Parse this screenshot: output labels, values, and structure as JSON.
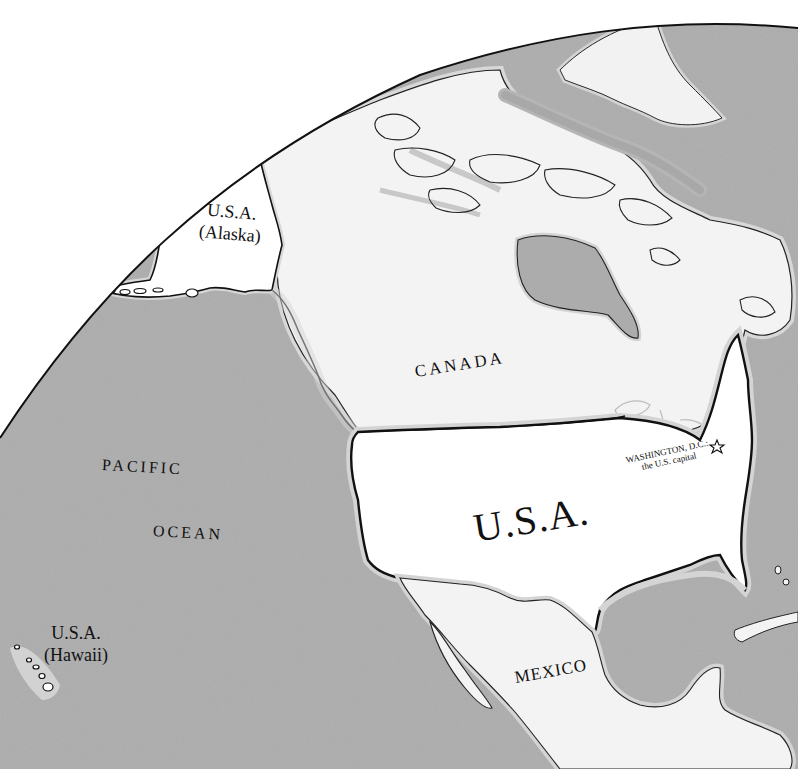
{
  "map": {
    "colors": {
      "background": "#ffffff",
      "ocean": "#a9a9a9",
      "ocean_shallow": "#d2d2d2",
      "land_usa": "#ffffff",
      "land_other": "#f2f2f2",
      "border": "#1a1a1a",
      "text": "#111111"
    },
    "labels": {
      "canada": "CANADA",
      "usa_main": "U.S.A.",
      "mexico": "MEXICO",
      "alaska_line1": "U.S.A.",
      "alaska_line2": "(Alaska)",
      "hawaii_line1": "U.S.A.",
      "hawaii_line2": "(Hawaii)",
      "pacific": "PACIFIC",
      "ocean": "OCEAN",
      "capital_line1": "WASHINGTON, D.C.:",
      "capital_line2": "the U.S. capital"
    },
    "icons": {
      "capital_marker": "star-icon"
    }
  }
}
